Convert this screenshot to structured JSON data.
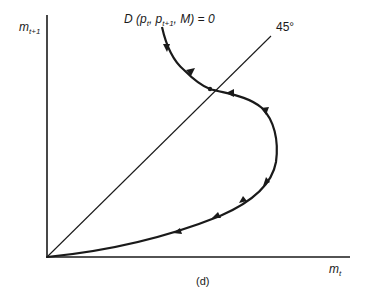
{
  "figure": {
    "panel_label": "(d)",
    "y_axis": {
      "var": "m",
      "sub": "t+1"
    },
    "x_axis": {
      "var": "m",
      "sub": "t"
    },
    "reference_line": {
      "label": "45°"
    },
    "curve": {
      "label_prefix": "D (p",
      "label_sub1": "t",
      "label_mid": ", p",
      "label_sub2": "t+1",
      "label_suffix": ", M) = 0"
    },
    "colors": {
      "ink": "#1a1a1a",
      "background": "#ffffff"
    }
  }
}
